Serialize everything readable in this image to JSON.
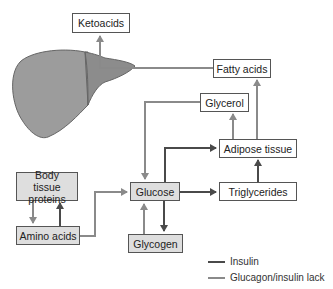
{
  "diagram": {
    "title": "",
    "organ": "liver",
    "nodes": [
      {
        "id": "ketoacids",
        "label": "Ketoacids",
        "filled": false
      },
      {
        "id": "fatty_acids",
        "label": "Fatty acids",
        "filled": false
      },
      {
        "id": "glycerol",
        "label": "Glycerol",
        "filled": false
      },
      {
        "id": "adipose_tissue",
        "label": "Adipose tissue",
        "filled": false
      },
      {
        "id": "body_tissue_proteins",
        "label": "Body tissue proteins",
        "filled": true
      },
      {
        "id": "glucose",
        "label": "Glucose",
        "filled": true
      },
      {
        "id": "triglycerides",
        "label": "Triglycerides",
        "filled": false
      },
      {
        "id": "amino_acids",
        "label": "Amino acids",
        "filled": true
      },
      {
        "id": "glycogen",
        "label": "Glycogen",
        "filled": true
      }
    ],
    "edges": [
      {
        "from": "liver",
        "to": "ketoacids",
        "type": "glucagon"
      },
      {
        "from": "fatty_acids",
        "to": "liver",
        "type": "glucagon"
      },
      {
        "from": "glycerol",
        "to": "glucose",
        "type": "glucagon"
      },
      {
        "from": "adipose_tissue",
        "to": "glycerol",
        "type": "glucagon"
      },
      {
        "from": "adipose_tissue",
        "to": "fatty_acids",
        "type": "glucagon"
      },
      {
        "from": "glucose",
        "to": "adipose_tissue",
        "type": "insulin"
      },
      {
        "from": "glucose",
        "to": "triglycerides",
        "type": "insulin"
      },
      {
        "from": "triglycerides",
        "to": "adipose_tissue",
        "type": "insulin"
      },
      {
        "from": "glucose",
        "to": "glycogen",
        "type": "insulin"
      },
      {
        "from": "glycogen",
        "to": "glucose",
        "type": "glucagon"
      },
      {
        "from": "amino_acids",
        "to": "glucose",
        "type": "glucagon"
      },
      {
        "from": "body_tissue_proteins",
        "to": "amino_acids",
        "type": "glucagon"
      },
      {
        "from": "amino_acids",
        "to": "body_tissue_proteins",
        "type": "insulin"
      }
    ]
  },
  "labels": {
    "ketoacids": "Ketoacids",
    "fatty_acids": "Fatty acids",
    "glycerol": "Glycerol",
    "adipose_tissue": "Adipose tissue",
    "body_tissue_proteins": "Body tissue proteins",
    "glucose": "Glucose",
    "triglycerides": "Triglycerides",
    "amino_acids": "Amino acids",
    "glycogen": "Glycogen"
  },
  "legend": {
    "insulin": {
      "label": "Insulin",
      "color": "#4a4a4a"
    },
    "glucagon": {
      "label": "Glucagon/insulin lack",
      "color": "#8a8a8a"
    }
  },
  "colors": {
    "insulin_line": "#4a4a4a",
    "glucagon_line": "#8a8a8a",
    "liver_main": "#9a9a9a",
    "liver_lobe": "#8c8c8c",
    "box_fill": "#dedede",
    "box_border": "#555555"
  }
}
